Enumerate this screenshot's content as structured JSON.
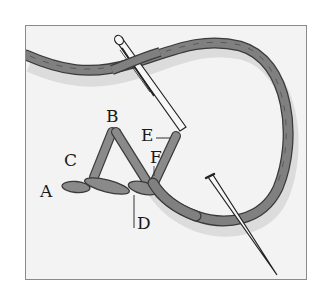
{
  "figure": {
    "labels": [
      {
        "id": "A",
        "text": "A",
        "x": 40,
        "y": 183
      },
      {
        "id": "B",
        "text": "B",
        "x": 106,
        "y": 108
      },
      {
        "id": "C",
        "text": "C",
        "x": 64,
        "y": 152
      },
      {
        "id": "D",
        "text": "D",
        "x": 137,
        "y": 215
      },
      {
        "id": "E",
        "text": "E",
        "x": 141,
        "y": 127
      },
      {
        "id": "F",
        "text": "F",
        "x": 150,
        "y": 149
      }
    ],
    "colors": {
      "thread": "#7e7e7e",
      "thread_dark": "#3a3a3a",
      "needle": "#f5f5f5",
      "frame_border": "#8a8a8a",
      "background": "#f3f3f3"
    }
  }
}
